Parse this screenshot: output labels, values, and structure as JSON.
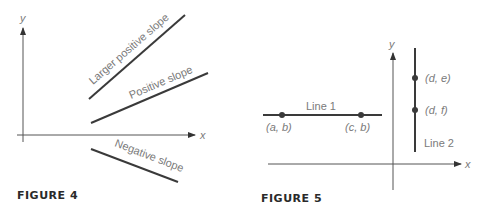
{
  "figure4": {
    "caption": "FIGURE 4",
    "axes": {
      "x_label": "x",
      "y_label": "y"
    },
    "lines": [
      {
        "label": "Larger positive slope",
        "slope": "larger positive"
      },
      {
        "label": "Positive slope",
        "slope": "positive"
      },
      {
        "label": "Negative slope",
        "slope": "negative"
      }
    ]
  },
  "figure5": {
    "caption": "FIGURE 5",
    "axes": {
      "x_label": "x",
      "y_label": "y"
    },
    "line1": {
      "label": "Line 1",
      "points": [
        {
          "label": "(a, b)"
        },
        {
          "label": "(c, b)"
        }
      ]
    },
    "line2": {
      "label": "Line 2",
      "points": [
        {
          "label": "(d, e)"
        },
        {
          "label": "(d, f)"
        }
      ]
    }
  },
  "colors": {
    "line": "#3a3a3a",
    "axis": "#555555",
    "label": "#7a7a7a"
  }
}
